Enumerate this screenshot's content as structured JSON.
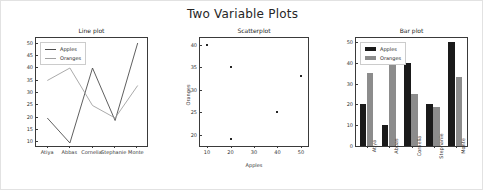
{
  "figure": {
    "suptitle": "Two Variable Plots",
    "background": "#ffffff",
    "border_color": "#e2e2e2"
  },
  "series_names": {
    "apples": "Apples",
    "oranges": "Oranges"
  },
  "colors": {
    "apples_line": "#4d4d4d",
    "oranges_line": "#a0a0a0",
    "apples_bar": "#1a1a1a",
    "oranges_bar": "#8c8c8c",
    "marker": "#262626",
    "axis": "#3a3a3a",
    "text": "#262626"
  },
  "chart_data": [
    {
      "type": "line",
      "title": "Line plot",
      "categories": [
        "Atiya",
        "Abbas",
        "Cornelia",
        "Stephanie",
        "Monte"
      ],
      "series": [
        {
          "name": "Apples",
          "values": [
            20,
            10,
            40,
            19,
            50
          ]
        },
        {
          "name": "Oranges",
          "values": [
            35,
            40,
            25,
            20,
            33
          ]
        }
      ],
      "xlabel": "",
      "ylabel": "",
      "ylim": [
        8,
        52
      ],
      "yticks": [
        10,
        15,
        20,
        25,
        30,
        35,
        40,
        45,
        50
      ],
      "grid": false,
      "legend_position": "upper left"
    },
    {
      "type": "scatter",
      "title": "Scatterplot",
      "x": [
        10,
        20,
        20,
        40,
        50
      ],
      "y": [
        40,
        35,
        19,
        25,
        33
      ],
      "points": [
        {
          "x": 10,
          "y": 40
        },
        {
          "x": 20,
          "y": 35
        },
        {
          "x": 20,
          "y": 19
        },
        {
          "x": 40,
          "y": 25
        },
        {
          "x": 50,
          "y": 33
        }
      ],
      "xlabel": "Apples",
      "ylabel": "Oranges",
      "xlim": [
        7,
        53
      ],
      "ylim": [
        17.5,
        41.5
      ],
      "xticks": [
        10,
        20,
        30,
        40,
        50
      ],
      "yticks": [
        20,
        25,
        30,
        35,
        40
      ],
      "grid": false,
      "legend_position": "none"
    },
    {
      "type": "bar",
      "title": "Bar plot",
      "categories": [
        "Atiya",
        "Abbas",
        "Cornelia",
        "Stephanie",
        "Monte"
      ],
      "series": [
        {
          "name": "Apples",
          "values": [
            20,
            10,
            40,
            20,
            50
          ]
        },
        {
          "name": "Oranges",
          "values": [
            35,
            40,
            25,
            19,
            33
          ]
        }
      ],
      "xlabel": "",
      "ylabel": "",
      "ylim": [
        0,
        52
      ],
      "yticks": [
        0,
        10,
        20,
        30,
        40,
        50
      ],
      "grid": false,
      "legend_position": "upper left"
    }
  ]
}
